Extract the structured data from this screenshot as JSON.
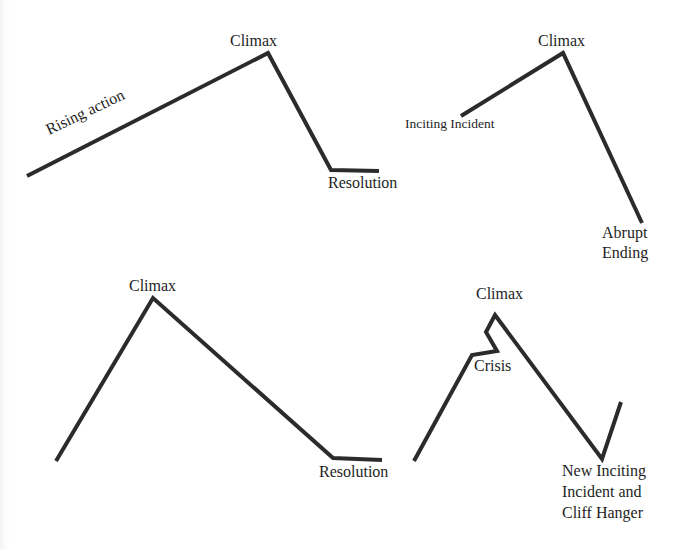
{
  "panels": [
    {
      "name": "classic-arc",
      "line_points": "27,176 268,53 331,170 379,171",
      "labels": {
        "rising": "Rising action",
        "climax": "Climax",
        "resolution": "Resolution"
      }
    },
    {
      "name": "abrupt-ending",
      "line_points": "461,116 563,53 642,223",
      "labels": {
        "inciting": "Inciting Incident",
        "climax": "Climax",
        "ending_line1": "Abrupt",
        "ending_line2": "Ending"
      }
    },
    {
      "name": "steep-rise",
      "line_points": "56,461 153,298 333,458 382,460",
      "labels": {
        "climax": "Climax",
        "resolution": "Resolution"
      }
    },
    {
      "name": "crisis-cliffhanger",
      "line_points": "414,461 472,355 497,351 486,332 495,315 602,459 621,402",
      "labels": {
        "climax": "Climax",
        "crisis": "Crisis",
        "new_line1": "New Inciting",
        "new_line2": "Incident and",
        "new_line3": "Cliff Hanger"
      }
    }
  ],
  "colors": {
    "line": "#2b2b2b",
    "text": "#1e1e1e",
    "background": "#ffffff"
  }
}
